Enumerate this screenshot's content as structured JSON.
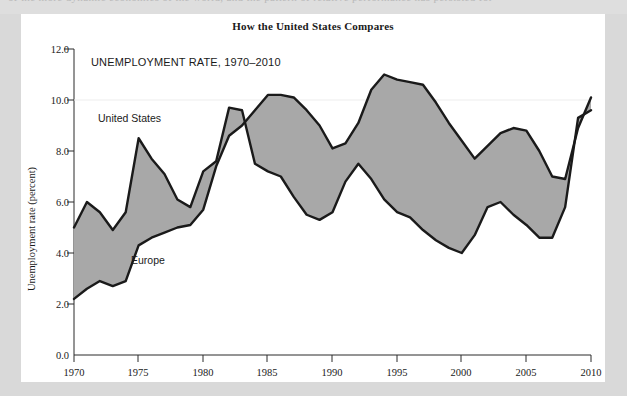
{
  "page": {
    "bleed_top_text": "of the more dynamic economies of the world, and the pattern of relative performance has persisted for",
    "background_color": "#d9d9d9",
    "card_color": "#ffffff"
  },
  "figure": {
    "title": "How the United States Compares",
    "subtitle": "UNEMPLOYMENT RATE, 1970–2010",
    "series_label_us": "United States",
    "series_label_europe": "Europe"
  },
  "chart_data": {
    "type": "area",
    "title": "How the United States Compares",
    "subtitle": "UNEMPLOYMENT RATE, 1970–2010",
    "xlabel": "",
    "ylabel": "Unemployment rate (percent)",
    "xlim": [
      1970,
      2010
    ],
    "ylim": [
      0.0,
      12.0
    ],
    "ytick_values": [
      0.0,
      2.0,
      4.0,
      6.0,
      8.0,
      10.0,
      12.0
    ],
    "ytick_labels": [
      "0.0",
      "2.0",
      "4.0",
      "6.0",
      "8.0",
      "10.0",
      "12.0"
    ],
    "xtick_values": [
      1970,
      1975,
      1980,
      1985,
      1990,
      1995,
      2000,
      2005,
      2010
    ],
    "xtick_labels": [
      "1970",
      "1975",
      "1980",
      "1985",
      "1990",
      "1995",
      "2000",
      "2005",
      "2010"
    ],
    "grid": false,
    "legend_position": "inline-annotation",
    "band_fill_color": "#a8a8a8",
    "line_color": "#1a1a1a",
    "x": [
      1970,
      1971,
      1972,
      1973,
      1974,
      1975,
      1976,
      1977,
      1978,
      1979,
      1980,
      1981,
      1982,
      1983,
      1984,
      1985,
      1986,
      1987,
      1988,
      1989,
      1990,
      1991,
      1992,
      1993,
      1994,
      1995,
      1996,
      1997,
      1998,
      1999,
      2000,
      2001,
      2002,
      2003,
      2004,
      2005,
      2006,
      2007,
      2008,
      2009,
      2010
    ],
    "series": [
      {
        "name": "United States",
        "values": [
          5.0,
          6.0,
          5.6,
          4.9,
          5.6,
          8.5,
          7.7,
          7.1,
          6.1,
          5.8,
          7.2,
          7.6,
          9.7,
          9.6,
          7.5,
          7.2,
          7.0,
          6.2,
          5.5,
          5.3,
          5.6,
          6.8,
          7.5,
          6.9,
          6.1,
          5.6,
          5.4,
          4.9,
          4.5,
          4.2,
          4.0,
          4.7,
          5.8,
          6.0,
          5.5,
          5.1,
          4.6,
          4.6,
          5.8,
          9.3,
          9.6
        ]
      },
      {
        "name": "Europe",
        "values": [
          2.2,
          2.6,
          2.9,
          2.7,
          2.9,
          4.3,
          4.6,
          4.8,
          5.0,
          5.1,
          5.7,
          7.4,
          8.6,
          9.0,
          9.6,
          10.2,
          10.2,
          10.1,
          9.6,
          9.0,
          8.1,
          8.3,
          9.1,
          10.4,
          11.0,
          10.8,
          10.7,
          10.6,
          9.9,
          9.1,
          8.4,
          7.7,
          8.2,
          8.7,
          8.9,
          8.8,
          8.0,
          7.0,
          6.9,
          8.9,
          10.1
        ]
      }
    ]
  }
}
